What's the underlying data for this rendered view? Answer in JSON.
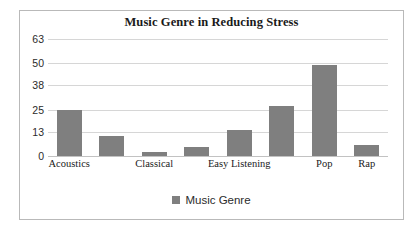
{
  "chart_data": {
    "type": "bar",
    "title": "Music Genre in Reducing Stress",
    "xlabel": "",
    "ylabel": "",
    "ylim": [
      0,
      63
    ],
    "yticks": [
      0,
      13,
      25,
      38,
      50,
      63
    ],
    "grid": true,
    "legend_position": "bottom",
    "categories": [
      "Acoustics",
      "Blues",
      "Classical",
      "Country",
      "Easy Listening",
      "Jazz",
      "Pop",
      "Rap"
    ],
    "visible_category_labels": [
      "Acoustics",
      "Classical",
      "Easy Listening",
      "Pop",
      "Rap"
    ],
    "series": [
      {
        "name": "Music Genre",
        "color": "#7f7f7f",
        "values": [
          25,
          11,
          2,
          5,
          14,
          27,
          49,
          6
        ]
      }
    ]
  },
  "legend": {
    "label": "Music Genre",
    "swatch_color": "#7f7f7f"
  },
  "frame": {
    "border_color": "#b9b9b9",
    "background": "#ffffff"
  }
}
